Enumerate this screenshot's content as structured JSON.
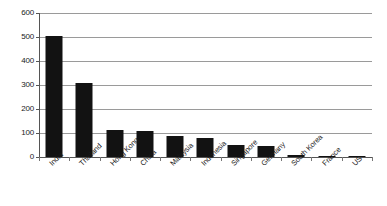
{
  "chart_data": {
    "type": "bar",
    "title": "",
    "subtitle": "",
    "xlabel": "",
    "ylabel": "",
    "ylim": [
      0,
      600
    ],
    "ytick_labels": [
      "0",
      "100",
      "200",
      "300",
      "400",
      "500",
      "600"
    ],
    "yticks": [
      0,
      100,
      200,
      300,
      400,
      500,
      600
    ],
    "grid": true,
    "legend": null,
    "legend_position": "none",
    "bar_color": "#121212",
    "gridline_color": "#9a9a9a",
    "axis_color": "#555555",
    "categories": [
      "India",
      "Thailand",
      "Hong Kong",
      "China",
      "Malaysia",
      "Indonesia",
      "Singapore",
      "Germany",
      "South Korea",
      "France",
      "US"
    ],
    "values": [
      505,
      308,
      112,
      107,
      88,
      79,
      50,
      45,
      10,
      5,
      2
    ]
  }
}
